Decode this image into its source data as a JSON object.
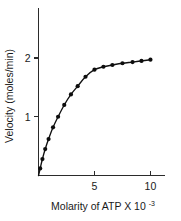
{
  "chart_data": {
    "type": "line",
    "title": "",
    "subtitle": "",
    "xlabel": "Molarity of ATP X 10",
    "xlabel_exponent": "-3",
    "ylabel": "Velocity (moles/min)",
    "xlim": [
      0,
      11.3
    ],
    "ylim": [
      0,
      2.85
    ],
    "xticks": [
      5,
      10
    ],
    "xtick_labels": [
      "5",
      "10"
    ],
    "yticks": [
      1,
      2
    ],
    "ytick_labels": [
      "1",
      "2"
    ],
    "grid": false,
    "legend": "none",
    "marker": "filled-circle",
    "series": [
      {
        "name": "ATP saturation curve",
        "x": [
          0.15,
          0.35,
          0.6,
          0.9,
          1.3,
          1.75,
          2.3,
          2.9,
          3.5,
          4.2,
          5.0,
          5.8,
          6.6,
          7.5,
          8.4,
          9.2,
          10.0
        ],
        "values": [
          0.12,
          0.28,
          0.45,
          0.62,
          0.82,
          1.0,
          1.2,
          1.38,
          1.52,
          1.68,
          1.8,
          1.85,
          1.88,
          1.91,
          1.93,
          1.95,
          1.97
        ]
      }
    ],
    "annotations": []
  }
}
